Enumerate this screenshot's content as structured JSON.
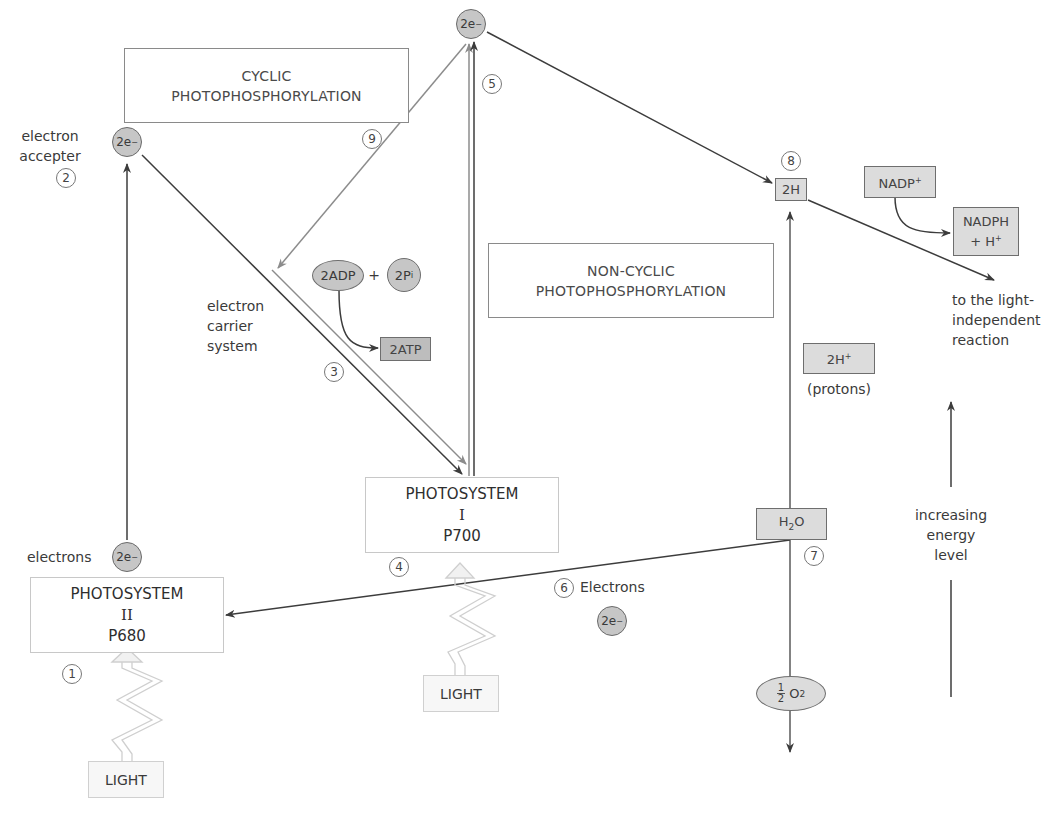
{
  "title_boxes": {
    "cyclic": {
      "line1": "CYCLIC",
      "line2": "PHOTOPHOSPHORYLATION"
    },
    "non_cyclic": {
      "line1": "NON-CYCLIC",
      "line2": "PHOTOPHOSPHORYLATION"
    }
  },
  "photosystems": {
    "ps2": {
      "line1": "PHOTOSYSTEM",
      "line2": "II",
      "line3": "P680"
    },
    "ps1": {
      "line1": "PHOTOSYSTEM",
      "line2": "I",
      "line3": "P700"
    }
  },
  "electrons": {
    "symbol": "2e",
    "charge": "−",
    "ps2_label": "electrons",
    "acceptor_label_1": "electron",
    "acceptor_label_2": "accepter",
    "water_label": "Electrons"
  },
  "carrier": {
    "line1": "electron",
    "line2": "carrier",
    "line3": "system"
  },
  "atp": {
    "adp": "2ADP",
    "plus": "+",
    "pi": "2P",
    "pi_sub": "i",
    "atp": "2ATP"
  },
  "hydrogen": {
    "two_h": "2H",
    "nadp": "NADP",
    "nadp_charge": "+",
    "nadph_1": "NADPH",
    "nadph_2": "+ H",
    "nadph_charge": "+",
    "protons": "2H",
    "protons_charge": "+",
    "protons_label": "(protons)",
    "water": "H",
    "water_sub": "2",
    "water_o": "O",
    "oxygen_frac_num": "1",
    "oxygen_frac_den": "2",
    "oxygen": "O",
    "oxygen_sub": "2"
  },
  "outputs": {
    "light_independent_1": "to the light-",
    "light_independent_2": "independent",
    "light_independent_3": "reaction"
  },
  "energy_axis": {
    "line1": "increasing",
    "line2": "energy",
    "line3": "level"
  },
  "light": {
    "label": "LIGHT"
  },
  "step_numbers": [
    "1",
    "2",
    "3",
    "4",
    "5",
    "6",
    "7",
    "8",
    "9"
  ],
  "colors": {
    "arrow_dark": "#3c3c3c",
    "arrow_light": "#8c8c8c",
    "electron_fill": "#c6c6c6",
    "box_fill": "#dcdcdc",
    "atp_fill": "#bdbdbd"
  }
}
